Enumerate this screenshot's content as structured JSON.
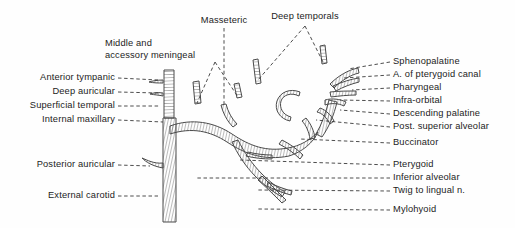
{
  "figure": {
    "background_color": "#fefefe",
    "ink_color": "#1c1c1c",
    "artery_fill": "#ffffff",
    "artery_stroke": "#555555",
    "leader_color": "#3a3a3a"
  },
  "labels_left": [
    {
      "text": "Anterior tympanic",
      "x": 116,
      "y": 78,
      "leader_to_x": 158,
      "leader_to_y": 80
    },
    {
      "text": "Deep auricular",
      "x": 116,
      "y": 92,
      "leader_to_x": 158,
      "leader_to_y": 93
    },
    {
      "text": "Superficial temporal",
      "x": 116,
      "y": 106,
      "leader_to_x": 160,
      "leader_to_y": 106
    },
    {
      "text": "Internal maxillary",
      "x": 116,
      "y": 120,
      "leader_to_x": 163,
      "leader_to_y": 122
    },
    {
      "text": "Posterior auricular",
      "x": 116,
      "y": 165,
      "leader_to_x": 150,
      "leader_to_y": 166
    },
    {
      "text": "External carotid",
      "x": 116,
      "y": 196,
      "leader_to_x": 158,
      "leader_to_y": 196
    }
  ],
  "labels_top": [
    {
      "text": "Middle and",
      "x": 160,
      "y": 44
    },
    {
      "text": "accessory meningeal",
      "x": 160,
      "y": 56
    },
    {
      "text": "Masseteric",
      "x": 224,
      "y": 20
    },
    {
      "text": "Deep temporals",
      "x": 305,
      "y": 16
    }
  ],
  "labels_right": [
    {
      "text": "Sphenopalatine",
      "x": 393,
      "y": 62,
      "leader_from_x": 348,
      "leader_from_y": 69
    },
    {
      "text": "A. of pterygoid canal",
      "x": 393,
      "y": 75,
      "leader_from_x": 344,
      "leader_from_y": 78
    },
    {
      "text": "Pharyngeal",
      "x": 393,
      "y": 88,
      "leader_from_x": 352,
      "leader_from_y": 90
    },
    {
      "text": "Infra-orbital",
      "x": 393,
      "y": 101,
      "leader_from_x": 340,
      "leader_from_y": 100
    },
    {
      "text": "Descending palatine",
      "x": 393,
      "y": 114,
      "leader_from_x": 340,
      "leader_from_y": 110
    },
    {
      "text": "Post. superior alveolar",
      "x": 393,
      "y": 127,
      "leader_from_x": 316,
      "leader_from_y": 120
    },
    {
      "text": "Buccinator",
      "x": 393,
      "y": 143,
      "leader_from_x": 300,
      "leader_from_y": 139
    },
    {
      "text": "Pterygoid",
      "x": 393,
      "y": 165,
      "leader_from_x": 240,
      "leader_from_y": 160
    },
    {
      "text": "Inferior alveolar",
      "x": 393,
      "y": 178,
      "leader_from_x": 196,
      "leader_from_y": 178
    },
    {
      "text": "Twig to lingual n.",
      "x": 393,
      "y": 191,
      "leader_from_x": 258,
      "leader_from_y": 190
    },
    {
      "text": "Mylohyoid",
      "x": 393,
      "y": 210,
      "leader_from_x": 258,
      "leader_from_y": 209
    }
  ],
  "leaders_special": {
    "meningeal_apex_x": 215,
    "meningeal_apex_y": 62,
    "meningeal_targets": [
      {
        "x": 197,
        "y": 103
      },
      {
        "x": 238,
        "y": 97
      }
    ],
    "masseteric_x": 224,
    "masseteric_y_top": 28,
    "masseteric_y_bottom": 104,
    "temporals_apex_x": 305,
    "temporals_apex_y": 26,
    "temporals_targets": [
      {
        "x": 258,
        "y": 80
      },
      {
        "x": 323,
        "y": 62
      }
    ]
  }
}
